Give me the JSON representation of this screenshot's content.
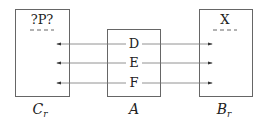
{
  "diagram": {
    "boxes": [
      {
        "id": "left",
        "header": "?P?",
        "caption": "C",
        "caption_sub": "r"
      },
      {
        "id": "center",
        "caption": "A",
        "ports": [
          "D",
          "E",
          "F"
        ]
      },
      {
        "id": "right",
        "header": "X",
        "caption": "B",
        "caption_sub": "r"
      }
    ],
    "arrows": [
      {
        "from": "D",
        "to_left": true,
        "to_right": true
      },
      {
        "from": "E",
        "to_left": true,
        "to_right": true
      },
      {
        "from": "F",
        "to_left": true,
        "to_right": true
      }
    ],
    "colors": {
      "stroke": "#555555",
      "text": "#222222",
      "dash": "#666666"
    }
  }
}
